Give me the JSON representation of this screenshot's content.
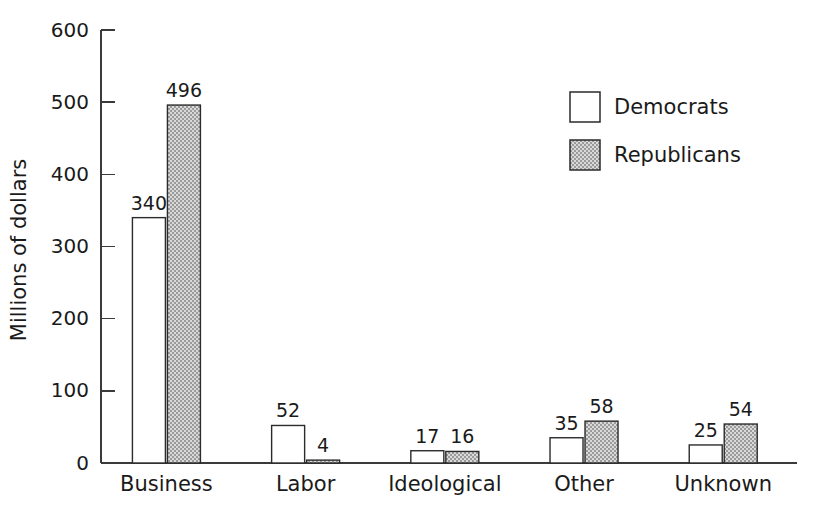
{
  "chart_data": {
    "type": "bar",
    "title": "",
    "xlabel": "",
    "ylabel": "Millions of dollars",
    "ylim": [
      0,
      600
    ],
    "ytick_values": [
      0,
      100,
      200,
      300,
      400,
      500,
      600
    ],
    "ytick_labels": [
      "0",
      "100",
      "200",
      "300",
      "400",
      "500",
      "600"
    ],
    "grid": false,
    "legend_position": "top-right",
    "categories": [
      "Business",
      "Labor",
      "Ideological",
      "Other",
      "Unknown"
    ],
    "series": [
      {
        "name": "Democrats",
        "color": "#ffffff",
        "edge_color": "#2b2b2b",
        "values": [
          340,
          52,
          17,
          35,
          25
        ],
        "value_labels": [
          "340",
          "52",
          "17",
          "35",
          "25"
        ]
      },
      {
        "name": "Republicans",
        "color": "#b0b0b0",
        "edge_color": "#2b2b2b",
        "values": [
          496,
          4,
          16,
          58,
          54
        ],
        "value_labels": [
          "496",
          "4",
          "16",
          "58",
          "54"
        ]
      }
    ]
  },
  "legend": {
    "entries": [
      {
        "label": "Democrats"
      },
      {
        "label": "Republicans"
      }
    ]
  },
  "axes": {
    "y_title": "Millions of dollars"
  }
}
